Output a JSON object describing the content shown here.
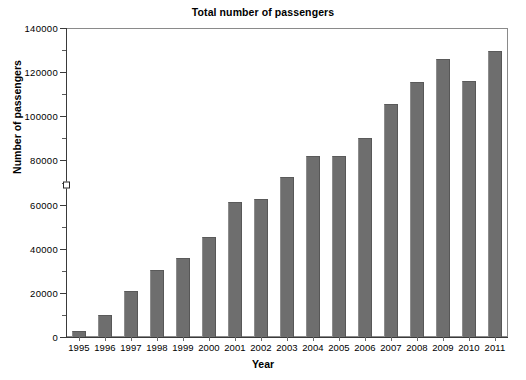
{
  "chart_data": {
    "type": "bar",
    "title": "Total number of passengers",
    "xlabel": "Year",
    "ylabel": "Number of passengers",
    "categories": [
      "1995",
      "1996",
      "1997",
      "1998",
      "1999",
      "2000",
      "2001",
      "2002",
      "2003",
      "2004",
      "2005",
      "2006",
      "2007",
      "2008",
      "2009",
      "2010",
      "2011"
    ],
    "values": [
      2500,
      10000,
      21000,
      30500,
      36000,
      45500,
      61000,
      62500,
      72500,
      82000,
      82000,
      90000,
      105500,
      115500,
      126000,
      116000,
      129500
    ],
    "ylim": [
      0,
      140000
    ],
    "ytick_labels": [
      "0",
      "20000",
      "40000",
      "60000",
      "80000",
      "100000",
      "120000",
      "140000"
    ],
    "ytick_values": [
      0,
      20000,
      40000,
      60000,
      80000,
      100000,
      120000,
      140000
    ],
    "yminor_values": [
      10000,
      30000,
      50000,
      70000,
      90000,
      110000,
      130000
    ],
    "axis_marker_value": 69000,
    "grid": false,
    "legend": null,
    "bar_color": "#6e6e6e",
    "axis_color": "#3a3a3a"
  }
}
